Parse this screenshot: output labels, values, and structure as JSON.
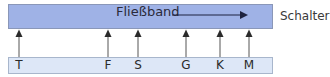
{
  "diagram": {
    "conveyor": {
      "label": "Fließband",
      "direction": "right"
    },
    "counter_label": "Schalter",
    "stations": [
      {
        "label": "T",
        "x": 19
      },
      {
        "label": "F",
        "x": 108
      },
      {
        "label": "S",
        "x": 138
      },
      {
        "label": "G",
        "x": 186
      },
      {
        "label": "K",
        "x": 220
      },
      {
        "label": "M",
        "x": 249
      }
    ],
    "colors": {
      "band": "#9fb2e6",
      "counter": "#dde7f7",
      "arrow": "#2a2a2a"
    }
  }
}
